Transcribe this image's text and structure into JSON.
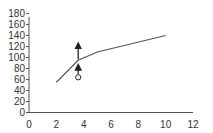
{
  "chart_data": {
    "type": "line",
    "title": "",
    "xlabel": "",
    "ylabel": "",
    "xlim": [
      0,
      12
    ],
    "ylim": [
      0,
      180
    ],
    "grid": false,
    "x_ticks": [
      "0",
      "2",
      "4",
      "6",
      "8",
      "10",
      "12"
    ],
    "y_ticks": [
      "0",
      "20",
      "40",
      "60",
      "80",
      "100",
      "120",
      "140",
      "160",
      "180"
    ],
    "series": [
      {
        "name": "line",
        "x": [
          2,
          3.6,
          5,
          10
        ],
        "y": [
          55,
          95,
          110,
          140
        ]
      }
    ],
    "annotations": [
      {
        "type": "arrow-up",
        "x": 3.6,
        "y_from": 97,
        "y_to": 122
      },
      {
        "type": "open-circle",
        "x": 3.6,
        "y": 64
      },
      {
        "type": "arrow-up",
        "x": 3.6,
        "y_from": 70,
        "y_to": 83
      }
    ]
  },
  "colors": {
    "axis": "#555555",
    "line": "#555555",
    "marker": "#222222"
  }
}
